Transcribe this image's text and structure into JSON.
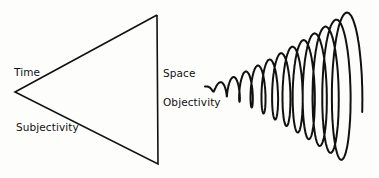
{
  "diagram": {
    "triangle": {
      "labels": {
        "time": "Time",
        "subjectivity": "Subjectivity",
        "space": "Space",
        "objectivity": "Objectivity"
      }
    },
    "spiral": {
      "description": "expanding helix spiral"
    },
    "colors": {
      "stroke": "#111111",
      "background": "#fdfdfc"
    }
  }
}
